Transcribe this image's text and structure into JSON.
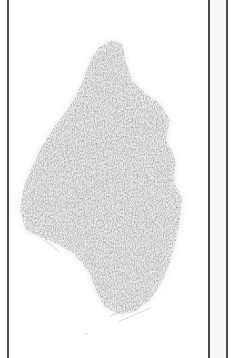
{
  "image": {
    "description": "Scanned pencil shading of an irregular tall blob shape within a page bordered by vertical lines",
    "caption": "",
    "colors": {
      "background": "#ffffff",
      "border_line": "#4a4a4a",
      "side_strip": "#f7f7f7",
      "shading": "#9a9a9a"
    },
    "frame": {
      "left_line_x": 7,
      "right_line_x": 208,
      "outer_line_x": 226
    }
  }
}
